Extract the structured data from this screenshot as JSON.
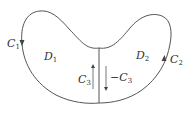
{
  "diagram": {
    "type": "region-decomposition",
    "stroke_color": "#555555",
    "labels": {
      "c1": {
        "main": "C",
        "sub": "1"
      },
      "c2": {
        "main": "C",
        "sub": "2"
      },
      "c3": {
        "main": "C",
        "sub": "3"
      },
      "neg_c3": {
        "main": "−C",
        "sub": "3"
      },
      "d1": {
        "main": "D",
        "sub": "1"
      },
      "d2": {
        "main": "D",
        "sub": "2"
      }
    },
    "arrows": {
      "c1": "down",
      "c2": "up",
      "c3": "up",
      "neg_c3": "down"
    }
  }
}
